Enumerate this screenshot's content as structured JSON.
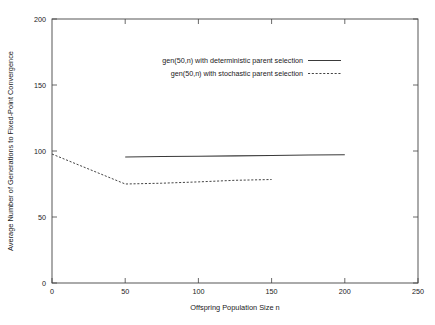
{
  "chart_data": {
    "type": "line",
    "title": "",
    "xlabel": "Offspring Population Size n",
    "ylabel": "Average Number of Generations to Fixed-Point Convergence",
    "xlim": [
      0,
      250
    ],
    "ylim": [
      0,
      200
    ],
    "xticks": [
      "0",
      "50",
      "100",
      "150",
      "200",
      "250"
    ],
    "xtick_values": [
      0,
      50,
      100,
      150,
      200,
      250
    ],
    "yticks": [
      "0",
      "50",
      "100",
      "150",
      "200"
    ],
    "ytick_values": [
      0,
      50,
      100,
      150,
      200
    ],
    "grid": false,
    "legend_position": "top-center-inside",
    "series": [
      {
        "name": "gen(50,n) with deterministic parent selection",
        "style": "solid",
        "x": [
          50,
          75,
          100,
          125,
          150,
          175,
          200
        ],
        "values": [
          95.5,
          95.8,
          96.1,
          96.3,
          96.6,
          96.9,
          97.2
        ]
      },
      {
        "name": "gen(50,n) with stochastic parent selection",
        "style": "dashed",
        "x": [
          0,
          50,
          75,
          100,
          125,
          150
        ],
        "values": [
          97.7,
          75.0,
          75.6,
          76.6,
          77.8,
          78.4
        ]
      }
    ]
  },
  "axes": {
    "x_axis_title": "Offspring Population Size n",
    "y_axis_title": "Average Number of Generations to Fixed-Point Convergence",
    "x_tick_labels": [
      "0",
      "50",
      "100",
      "150",
      "200",
      "250"
    ],
    "y_tick_labels": [
      "0",
      "50",
      "100",
      "150",
      "200"
    ]
  },
  "legend": {
    "entries": [
      {
        "label": "gen(50,n) with deterministic parent selection",
        "style": "solid"
      },
      {
        "label": "gen(50,n) with stochastic parent selection",
        "style": "dashed"
      }
    ]
  }
}
